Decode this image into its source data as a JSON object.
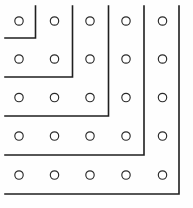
{
  "figure": {
    "background_color": "#fefefe",
    "line_color": "#1f1f1f",
    "circle_stroke_color": "#2a2a2a",
    "circle_fill_color": "#ffffff",
    "line_width": 1.6,
    "circle_radius": 4.2,
    "width": 193,
    "height": 208
  },
  "grid": {
    "rows": 5,
    "columns": 5,
    "column_x": [
      19,
      54.5,
      90,
      126,
      162.5
    ],
    "row_y": [
      21,
      59,
      97.5,
      136,
      175
    ],
    "total_points": 25,
    "point_label": "grid-dot"
  },
  "gnomons": {
    "count": 5,
    "shapes": [
      {
        "index": 1,
        "name": "gnomon-1",
        "encloses_points": 1,
        "corner_x": 35.5,
        "corner_y": 38,
        "start_x": 5,
        "end_y": 6,
        "points": "35.5,6 35.5,38 5,38"
      },
      {
        "index": 2,
        "name": "gnomon-2",
        "encloses_points": 4,
        "corner_x": 72.5,
        "corner_y": 77,
        "start_x": 5,
        "end_y": 6,
        "points": "72.5,6 72.5,77 5,77"
      },
      {
        "index": 3,
        "name": "gnomon-3",
        "encloses_points": 9,
        "corner_x": 108.5,
        "corner_y": 116,
        "start_x": 5,
        "end_y": 6,
        "points": "108.5,6 108.5,116 5,116"
      },
      {
        "index": 4,
        "name": "gnomon-4",
        "encloses_points": 16,
        "corner_x": 144,
        "corner_y": 155,
        "start_x": 5,
        "end_y": 6,
        "points": "144,6 144,155 5,155"
      },
      {
        "index": 5,
        "name": "gnomon-5",
        "encloses_points": 25,
        "corner_x": 179,
        "corner_y": 194,
        "start_x": 5,
        "end_y": 6,
        "points": "179,6 179,194 5,194"
      }
    ]
  }
}
